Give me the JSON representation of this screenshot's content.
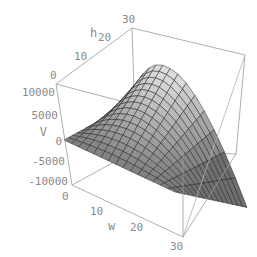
{
  "chart_data": {
    "type": "surface3d",
    "title": "",
    "axes": {
      "x": {
        "label": "w",
        "ticks": [
          0,
          10,
          20,
          30
        ],
        "range": [
          0,
          30
        ]
      },
      "y": {
        "label": "h",
        "ticks": [
          0,
          10,
          20,
          30
        ],
        "range": [
          0,
          30
        ]
      },
      "z": {
        "label": "V",
        "ticks": [
          10000,
          5000,
          0,
          -5000,
          -10000
        ],
        "range": [
          -10000,
          10000
        ]
      }
    },
    "tick_labels": {
      "w": [
        "0",
        "10",
        "20",
        "30"
      ],
      "h": [
        "0",
        "10",
        "20",
        "30"
      ],
      "V": [
        "10000",
        "5000",
        "0",
        "-5000",
        "-10000"
      ]
    },
    "surface": {
      "description": "V(w,h) saddle-shaped hump; maximum near w≈10–15, h≈30 (~+11000); falls to ~0 at w=0 and drops steeply toward -10000 at large w",
      "mesh_lines": 15,
      "shading": "gray",
      "peak_value": 11000,
      "min_value": -10000
    },
    "box": true,
    "grid": false,
    "legend": null
  }
}
